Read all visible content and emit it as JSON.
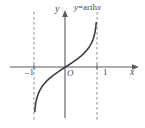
{
  "figure": {
    "title": "y=arthx",
    "background_color": "#ffffff",
    "line_color": "#555555",
    "text_color": "#4a4a4a",
    "dash_color": "#888888"
  },
  "labels": {
    "y_axis": "y",
    "x_axis": "x",
    "origin": "O",
    "tick_neg_one": "–1",
    "tick_pos_one": "1",
    "curve_equation_var": "y",
    "curve_equation_eq": "=arth",
    "curve_equation_arg": "x"
  },
  "chart_data": {
    "type": "line",
    "title": "y=arthx",
    "xlabel": "x",
    "ylabel": "y",
    "xlim": [
      -1.35,
      1.35
    ],
    "ylim": [
      -2.6,
      2.6
    ],
    "grid": false,
    "legend": "none",
    "xticks": [
      -1,
      1
    ],
    "xticklabels": [
      "–1",
      "1"
    ],
    "yticks": [],
    "yticklabels": [],
    "annotations": [
      {
        "text": "y=arthx",
        "x": 0.55,
        "y": 2.45
      },
      {
        "text": "O",
        "x": 0.08,
        "y": -0.22
      }
    ],
    "asymptotes": [
      {
        "type": "vertical",
        "x": -1,
        "style": "dashed"
      },
      {
        "type": "vertical",
        "x": 1,
        "style": "dashed"
      }
    ],
    "series": [
      {
        "name": "y = arth x",
        "style": "solid",
        "x": [
          -0.975,
          -0.96,
          -0.94,
          -0.91,
          -0.87,
          -0.82,
          -0.76,
          -0.69,
          -0.6,
          -0.5,
          -0.4,
          -0.3,
          -0.2,
          -0.1,
          0,
          0.1,
          0.2,
          0.3,
          0.4,
          0.5,
          0.6,
          0.69,
          0.76,
          0.82,
          0.87,
          0.91,
          0.94,
          0.96,
          0.975
        ],
        "y": [
          -2.185,
          -1.946,
          -1.738,
          -1.528,
          -1.333,
          -1.157,
          -0.996,
          -0.848,
          -0.693,
          -0.549,
          -0.424,
          -0.31,
          -0.203,
          -0.1,
          0,
          0.1,
          0.203,
          0.31,
          0.424,
          0.549,
          0.693,
          0.848,
          0.996,
          1.157,
          1.333,
          1.528,
          1.738,
          1.946,
          2.185
        ]
      }
    ]
  }
}
